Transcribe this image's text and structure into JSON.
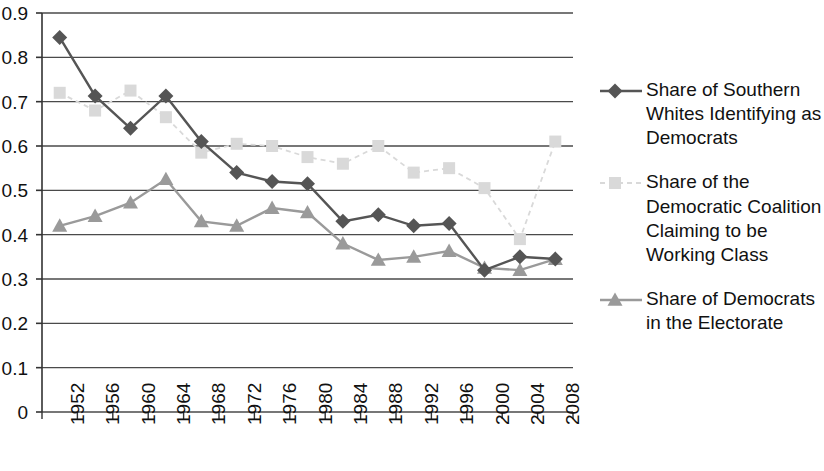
{
  "chart_data": {
    "type": "line",
    "title": "",
    "xlabel": "",
    "ylabel": "",
    "grid": true,
    "legend_position": "right",
    "ylim": [
      0,
      0.9
    ],
    "ytick_labels": [
      "0.9",
      "0.8",
      "0.7",
      "0.6",
      "0.5",
      "0.4",
      "0.3",
      "0.2",
      "0.1",
      "0"
    ],
    "ytick_values": [
      0.9,
      0.8,
      0.7,
      0.6,
      0.5,
      0.4,
      0.3,
      0.2,
      0.1,
      0
    ],
    "categories": [
      "1952",
      "1956",
      "1960",
      "1964",
      "1968",
      "1972",
      "1976",
      "1980",
      "1984",
      "1988",
      "1992",
      "1996",
      "2000",
      "2004",
      "2008"
    ],
    "x": [
      1952,
      1956,
      1960,
      1964,
      1968,
      1972,
      1976,
      1980,
      1984,
      1988,
      1992,
      1996,
      2000,
      2004,
      2008
    ],
    "series": [
      {
        "name": "Share of Southern Whites Identifying as Democrats",
        "marker": "diamond",
        "line_style": "solid",
        "color": "#555555",
        "values": [
          0.845,
          0.713,
          0.64,
          0.713,
          0.61,
          0.54,
          0.52,
          0.515,
          0.43,
          0.445,
          0.42,
          0.425,
          0.32,
          0.35,
          0.345
        ]
      },
      {
        "name": "Share of the Democratic Coalition Claiming to be Working Class",
        "marker": "square",
        "line_style": "dashed",
        "color": "#d9d9d9",
        "values": [
          0.72,
          0.68,
          0.725,
          0.665,
          0.585,
          0.605,
          0.6,
          0.575,
          0.56,
          0.6,
          0.54,
          0.55,
          0.505,
          0.39,
          0.61
        ]
      },
      {
        "name": "Share of Democrats in the Electorate",
        "marker": "triangle",
        "line_style": "solid",
        "color": "#9a9a9a",
        "values": [
          0.42,
          0.442,
          0.472,
          0.525,
          0.43,
          0.42,
          0.46,
          0.45,
          0.38,
          0.343,
          0.35,
          0.363,
          0.325,
          0.32,
          0.345
        ]
      }
    ]
  },
  "legend": {
    "entries": [
      {
        "label": "Share of Southern Whites Identifying as Democrats",
        "key": "diamond-marker-key"
      },
      {
        "label": "Share of the Democratic Coalition Claiming to be Working Class",
        "key": "square-marker-key"
      },
      {
        "label": "Share of Democrats in the Electorate",
        "key": "triangle-marker-key"
      }
    ]
  }
}
